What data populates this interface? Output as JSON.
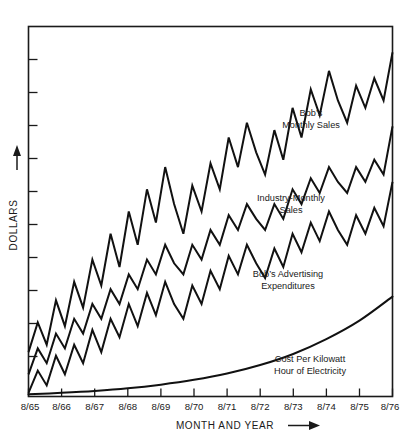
{
  "chart_data": {
    "type": "line",
    "title": "",
    "xlabel": "MONTH AND YEAR",
    "ylabel": "DOLLARS",
    "xlabel_arrow": "⟶",
    "ylabel_arrow": "↑",
    "grid": false,
    "legend_position": "inline-annotations",
    "categories": [
      "8/65",
      "8/66",
      "8/67",
      "8/68",
      "8/69",
      "8/70",
      "8/71",
      "8/72",
      "8/73",
      "8/74",
      "8/75",
      "8/76"
    ],
    "x": [
      1965.67,
      1966.67,
      1967.67,
      1968.67,
      1969.67,
      1970.67,
      1971.67,
      1972.67,
      1973.67,
      1974.67,
      1975.67,
      1976.67
    ],
    "xlim": [
      1965.67,
      1976.67
    ],
    "ylim": [
      0,
      100
    ],
    "y_axis_ticks": 10,
    "y_tick_labels": [],
    "series": [
      {
        "name": "Bob's Monthly Sales",
        "label_lines": [
          "Bob’s",
          "Monthly Sales"
        ],
        "label_x": 1972.1,
        "label_y": 62,
        "x": [
          1965.67,
          1965.95,
          1966.22,
          1966.5,
          1966.77,
          1967.05,
          1967.32,
          1967.6,
          1967.87,
          1968.15,
          1968.42,
          1968.7,
          1968.97,
          1969.25,
          1969.52,
          1969.8,
          1970.07,
          1970.35,
          1970.62,
          1970.9,
          1971.17,
          1971.45,
          1971.72,
          1972.0,
          1972.27,
          1972.55,
          1972.82,
          1973.1,
          1973.37,
          1973.65,
          1973.92,
          1974.2,
          1974.47,
          1974.75,
          1975.02,
          1975.3,
          1975.57,
          1975.85,
          1976.12,
          1976.4,
          1976.67
        ],
        "values": [
          12,
          20,
          14,
          26,
          19,
          31,
          24,
          37,
          30,
          44,
          35,
          50,
          41,
          56,
          47,
          62,
          52,
          44,
          57,
          50,
          63,
          56,
          70,
          62,
          74,
          66,
          60,
          72,
          64,
          78,
          70,
          83,
          76,
          88,
          80,
          74,
          84,
          78,
          86,
          80,
          93
        ],
        "pattern": "sawtooth-rising"
      },
      {
        "name": "Industry-Monthly Sales",
        "label_lines": [
          "Industry-Monthly",
          "Sales"
        ],
        "label_x": 1971.5,
        "label_y": 42,
        "x": [
          1965.67,
          1965.95,
          1966.22,
          1966.5,
          1966.77,
          1967.05,
          1967.32,
          1967.6,
          1967.87,
          1968.15,
          1968.42,
          1968.7,
          1968.97,
          1969.25,
          1969.52,
          1969.8,
          1970.07,
          1970.35,
          1970.62,
          1970.9,
          1971.17,
          1971.45,
          1971.72,
          1972.0,
          1972.27,
          1972.55,
          1972.82,
          1973.1,
          1973.37,
          1973.65,
          1973.92,
          1974.2,
          1974.47,
          1974.75,
          1975.02,
          1975.3,
          1975.57,
          1975.85,
          1976.12,
          1976.4,
          1976.67
        ],
        "values": [
          6,
          13,
          9,
          17,
          13,
          21,
          17,
          25,
          21,
          29,
          25,
          33,
          29,
          37,
          33,
          41,
          36,
          33,
          41,
          37,
          45,
          41,
          49,
          45,
          52,
          48,
          45,
          52,
          48,
          56,
          52,
          59,
          55,
          62,
          58,
          55,
          62,
          58,
          64,
          60,
          73
        ],
        "pattern": "sawtooth-rising"
      },
      {
        "name": "Bob's Advertising Expenditures",
        "label_lines": [
          "Bob’s Advertising",
          "Expenditures"
        ],
        "label_x": 1971.1,
        "label_y": 24,
        "x": [
          1965.67,
          1965.95,
          1966.22,
          1966.5,
          1966.77,
          1967.05,
          1967.32,
          1967.6,
          1967.87,
          1968.15,
          1968.42,
          1968.7,
          1968.97,
          1969.25,
          1969.52,
          1969.8,
          1970.07,
          1970.35,
          1970.62,
          1970.9,
          1971.17,
          1971.45,
          1971.72,
          1972.0,
          1972.27,
          1972.55,
          1972.82,
          1973.1,
          1973.37,
          1973.65,
          1973.92,
          1974.2,
          1974.47,
          1974.75,
          1975.02,
          1975.3,
          1975.57,
          1975.85,
          1976.12,
          1976.4,
          1976.67
        ],
        "values": [
          1,
          7,
          3,
          11,
          6,
          14,
          9,
          18,
          12,
          21,
          16,
          25,
          19,
          28,
          22,
          31,
          25,
          21,
          30,
          25,
          34,
          29,
          38,
          33,
          41,
          36,
          32,
          40,
          35,
          44,
          39,
          47,
          42,
          50,
          45,
          41,
          49,
          44,
          51,
          46,
          58
        ],
        "pattern": "sawtooth-rising"
      },
      {
        "name": "Cost Per Kilowatt Hour of Electricity",
        "label_lines": [
          "Cost Per Kilowatt",
          "Hour of Electricity"
        ],
        "label_x": 1972.4,
        "label_y": 7,
        "x": [
          1965.67,
          1966.67,
          1967.67,
          1968.67,
          1969.67,
          1970.67,
          1971.67,
          1972.67,
          1973.67,
          1974.67,
          1975.67,
          1976.67
        ],
        "values": [
          0.6,
          1.0,
          1.5,
          2.2,
          3.2,
          4.5,
          6.2,
          8.5,
          11.5,
          15.5,
          20.5,
          27.0
        ],
        "pattern": "smooth-exponential"
      }
    ]
  }
}
